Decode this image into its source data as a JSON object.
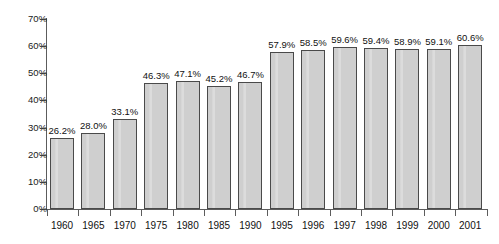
{
  "chart_data": {
    "type": "bar",
    "title": "",
    "subtitle": "",
    "xlabel": "",
    "ylabel": "",
    "ylim": [
      0,
      70
    ],
    "ytick_labels": [
      "0%",
      "10%",
      "20%",
      "30%",
      "40%",
      "50%",
      "60%",
      "70%"
    ],
    "ytick_values": [
      0,
      10,
      20,
      30,
      40,
      50,
      60,
      70
    ],
    "grid": false,
    "legend": null,
    "value_suffix": "%",
    "categories": [
      "1960",
      "1965",
      "1970",
      "1975",
      "1980",
      "1985",
      "1990",
      "1995",
      "1996",
      "1997",
      "1998",
      "1999",
      "2000",
      "2001"
    ],
    "values": [
      26.2,
      28.0,
      33.1,
      46.3,
      47.1,
      45.2,
      46.7,
      57.9,
      58.5,
      59.6,
      59.4,
      58.9,
      59.1,
      60.6
    ],
    "data_labels": [
      "26.2%",
      "28.0%",
      "33.1%",
      "46.3%",
      "47.1%",
      "45.2%",
      "46.7%",
      "57.9%",
      "58.5%",
      "59.6%",
      "59.4%",
      "58.9%",
      "59.1%",
      "60.6%"
    ],
    "colors": {
      "bar_fill": "#cfcfcf",
      "bar_highlight": "#dcdcdc",
      "bar_border": "#4a4a4a",
      "axis": "#5c5c5c",
      "text": "#111111",
      "background": "#ffffff"
    }
  }
}
